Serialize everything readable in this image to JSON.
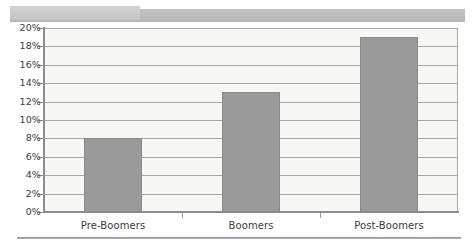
{
  "banner": {
    "wide_band_color": "#bdbdbd",
    "short_band_color": "#cbcbcb"
  },
  "footer": {
    "rule_color": "#8f8f8f"
  },
  "chart_data": {
    "type": "bar",
    "title": "",
    "subtitle": "",
    "xlabel": "",
    "ylabel": "",
    "categories": [
      "Pre-Boomers",
      "Boomers",
      "Post-Boomers"
    ],
    "values": [
      8,
      13,
      19
    ],
    "value_suffix": "%",
    "ylim": [
      0,
      20
    ],
    "ytick_step": 2,
    "ytick_labels": [
      "20%",
      "18%",
      "16%",
      "14%",
      "12%",
      "10%",
      "8%",
      "6%",
      "4%",
      "2%",
      "0%"
    ],
    "ytick_values": [
      20,
      18,
      16,
      14,
      12,
      10,
      8,
      6,
      4,
      2,
      0
    ],
    "grid": true,
    "legend": false,
    "legend_position": "none",
    "series": [
      {
        "name": "",
        "values": [
          8,
          13,
          19
        ],
        "color": "#9a9a9a"
      }
    ],
    "bar_color": "#9a9a9a",
    "bar_border_color": "#8a8a8a",
    "plot_background": "#f7f7f5",
    "gridline_color": "#a9a9a9",
    "axis_color": "#8d8d8d",
    "annotations": []
  }
}
